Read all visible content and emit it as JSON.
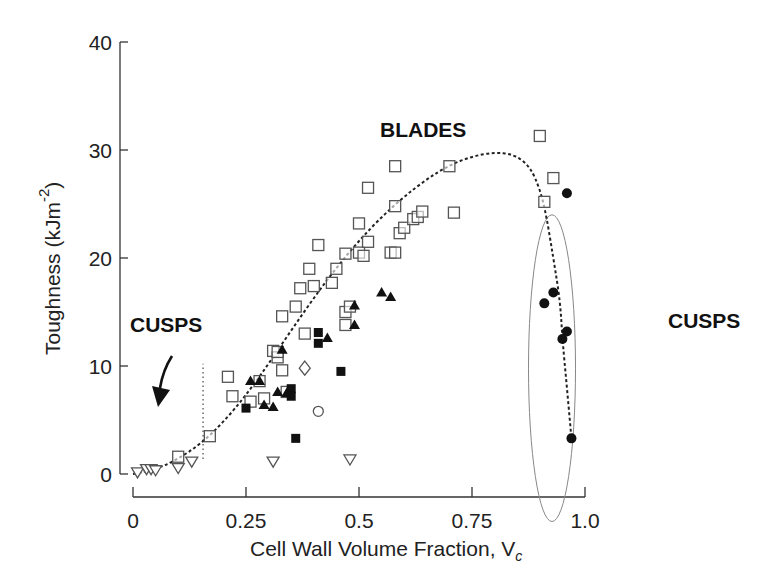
{
  "chart_data": {
    "type": "scatter",
    "title": "",
    "xlabel": "Cell Wall Volume Fraction, V",
    "xlabel_subscript": "c",
    "ylabel": "Toughness (kJm",
    "ylabel_superscript": "-2",
    "ylabel_close": ")",
    "xlim": [
      0,
      1.0
    ],
    "ylim": [
      0,
      40
    ],
    "xticks": [
      "0",
      "0.25",
      "0.5",
      "0.75",
      "1.0"
    ],
    "xtick_values": [
      0,
      0.25,
      0.5,
      0.75,
      1.0
    ],
    "yticks": [
      "0",
      "10",
      "20",
      "30",
      "40"
    ],
    "ytick_values": [
      0,
      10,
      20,
      30,
      40
    ],
    "grid": false,
    "legend": null,
    "annotations": [
      {
        "text": "BLADES",
        "x": 0.54,
        "y": 31.5
      },
      {
        "text": "CUSPS",
        "x": 0.11,
        "y": 12.3,
        "arrow_to": [
          0.07,
          6.0
        ]
      },
      {
        "text": "CUSPS",
        "x": 1.06,
        "y": 13.5
      }
    ],
    "series": [
      {
        "name": "open squares",
        "marker": "square-open",
        "points": [
          [
            0.1,
            1.6
          ],
          [
            0.17,
            3.5
          ],
          [
            0.21,
            9.0
          ],
          [
            0.22,
            7.2
          ],
          [
            0.26,
            6.7
          ],
          [
            0.28,
            8.6
          ],
          [
            0.29,
            7.0
          ],
          [
            0.31,
            11.4
          ],
          [
            0.32,
            10.8
          ],
          [
            0.32,
            11.3
          ],
          [
            0.33,
            9.6
          ],
          [
            0.34,
            7.6
          ],
          [
            0.33,
            14.6
          ],
          [
            0.36,
            15.5
          ],
          [
            0.37,
            17.2
          ],
          [
            0.38,
            13.0
          ],
          [
            0.39,
            19.0
          ],
          [
            0.4,
            17.4
          ],
          [
            0.41,
            21.2
          ],
          [
            0.44,
            17.7
          ],
          [
            0.45,
            19.0
          ],
          [
            0.47,
            20.4
          ],
          [
            0.47,
            13.8
          ],
          [
            0.47,
            15.0
          ],
          [
            0.48,
            15.5
          ],
          [
            0.5,
            23.2
          ],
          [
            0.5,
            20.5
          ],
          [
            0.51,
            20.2
          ],
          [
            0.52,
            21.5
          ],
          [
            0.52,
            26.5
          ],
          [
            0.57,
            20.5
          ],
          [
            0.58,
            20.5
          ],
          [
            0.58,
            24.8
          ],
          [
            0.58,
            28.5
          ],
          [
            0.59,
            22.3
          ],
          [
            0.6,
            22.8
          ],
          [
            0.62,
            23.6
          ],
          [
            0.63,
            23.8
          ],
          [
            0.64,
            24.3
          ],
          [
            0.7,
            28.5
          ],
          [
            0.71,
            24.2
          ],
          [
            0.9,
            31.3
          ],
          [
            0.91,
            25.2
          ],
          [
            0.93,
            27.4
          ]
        ]
      },
      {
        "name": "filled triangles",
        "marker": "triangle-filled",
        "points": [
          [
            0.26,
            8.6
          ],
          [
            0.28,
            8.6
          ],
          [
            0.29,
            6.4
          ],
          [
            0.31,
            6.2
          ],
          [
            0.32,
            7.6
          ],
          [
            0.33,
            11.5
          ],
          [
            0.34,
            7.5
          ],
          [
            0.43,
            12.6
          ],
          [
            0.49,
            15.6
          ],
          [
            0.49,
            13.8
          ],
          [
            0.55,
            16.8
          ],
          [
            0.57,
            16.4
          ]
        ]
      },
      {
        "name": "filled squares",
        "marker": "square-filled",
        "points": [
          [
            0.25,
            6.1
          ],
          [
            0.35,
            7.9
          ],
          [
            0.35,
            7.2
          ],
          [
            0.36,
            3.3
          ],
          [
            0.41,
            13.1
          ],
          [
            0.41,
            12.1
          ],
          [
            0.46,
            9.5
          ]
        ]
      },
      {
        "name": "open diamond",
        "marker": "diamond-open",
        "points": [
          [
            0.38,
            9.8
          ]
        ]
      },
      {
        "name": "open circle",
        "marker": "circle-open",
        "points": [
          [
            0.41,
            5.8
          ]
        ]
      },
      {
        "name": "open inverted triangles",
        "marker": "triangle-down-open",
        "points": [
          [
            0.01,
            0.1
          ],
          [
            0.03,
            0.4
          ],
          [
            0.04,
            0.4
          ],
          [
            0.05,
            0.3
          ],
          [
            0.1,
            0.5
          ],
          [
            0.13,
            1.1
          ],
          [
            0.31,
            1.1
          ],
          [
            0.48,
            1.3
          ]
        ]
      },
      {
        "name": "filled circles (cusps)",
        "marker": "circle-filled",
        "points": [
          [
            0.91,
            15.8
          ],
          [
            0.93,
            16.8
          ],
          [
            0.95,
            12.5
          ],
          [
            0.96,
            13.2
          ],
          [
            0.96,
            26.0
          ],
          [
            0.97,
            3.3
          ]
        ]
      }
    ],
    "trend_line": {
      "style": "dashed",
      "points": [
        [
          0.0,
          0.0
        ],
        [
          0.05,
          0.4
        ],
        [
          0.1,
          1.4
        ],
        [
          0.15,
          2.8
        ],
        [
          0.2,
          4.8
        ],
        [
          0.25,
          7.3
        ],
        [
          0.3,
          10.2
        ],
        [
          0.35,
          13.3
        ],
        [
          0.4,
          16.3
        ],
        [
          0.45,
          19.1
        ],
        [
          0.5,
          21.6
        ],
        [
          0.55,
          23.8
        ],
        [
          0.6,
          25.7
        ],
        [
          0.65,
          27.3
        ],
        [
          0.7,
          28.6
        ],
        [
          0.75,
          29.4
        ],
        [
          0.8,
          29.8
        ],
        [
          0.84,
          29.6
        ],
        [
          0.87,
          28.8
        ],
        [
          0.89,
          27.5
        ],
        [
          0.91,
          25.0
        ],
        [
          0.93,
          20.0
        ],
        [
          0.945,
          16.0
        ],
        [
          0.95,
          12.5
        ],
        [
          0.96,
          8.0
        ],
        [
          0.97,
          3.3
        ]
      ]
    },
    "vertical_dotted_line": {
      "x": 0.155,
      "y_from": 1.4,
      "y_to": 10.2
    },
    "ellipse": {
      "cx": 0.927,
      "cy": 9.8,
      "rx": 0.052,
      "ry": 14.2
    }
  }
}
